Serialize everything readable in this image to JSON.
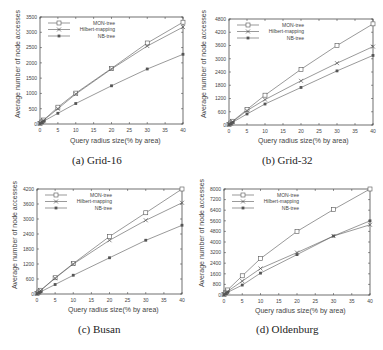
{
  "chart_data": [
    {
      "type": "line",
      "title": "Grid-16",
      "caption": "(a) Grid-16",
      "xlabel": "Query radius size(% by area)",
      "ylabel": "Average number of node accesses",
      "x": [
        0,
        0.5,
        1,
        5,
        10,
        20,
        30,
        40
      ],
      "xticks": [
        0,
        5,
        10,
        15,
        20,
        25,
        30,
        35,
        40
      ],
      "yticks": [
        0,
        500,
        1000,
        1500,
        2000,
        2500,
        3000,
        3500
      ],
      "xlim": [
        0,
        40
      ],
      "ylim": [
        0,
        3500
      ],
      "legend_position": "top-left",
      "series": [
        {
          "name": "MON-tree",
          "marker": "open-square",
          "values": [
            20,
            70,
            130,
            550,
            1010,
            1820,
            2650,
            3330
          ]
        },
        {
          "name": "Hilbert-mapping",
          "marker": "cross",
          "values": [
            20,
            65,
            120,
            500,
            980,
            1800,
            2550,
            3170
          ]
        },
        {
          "name": "NB-tree",
          "marker": "filled-square",
          "values": [
            15,
            45,
            90,
            350,
            670,
            1250,
            1800,
            2280
          ]
        }
      ]
    },
    {
      "type": "line",
      "title": "Grid-32",
      "caption": "(b) Grid-32",
      "xlabel": "Query radius size(% by area)",
      "ylabel": "Average number of node accesses",
      "x": [
        0,
        0.5,
        1,
        5,
        10,
        20,
        30,
        40
      ],
      "xticks": [
        0,
        5,
        10,
        15,
        20,
        25,
        30,
        35,
        40
      ],
      "yticks": [
        0,
        600,
        1200,
        1800,
        2400,
        3000,
        3600,
        4200,
        4800
      ],
      "xlim": [
        0,
        40
      ],
      "ylim": [
        0,
        4800
      ],
      "legend_position": "top-left",
      "series": [
        {
          "name": "MON-tree",
          "marker": "open-square",
          "values": [
            30,
            90,
            170,
            700,
            1350,
            2520,
            3600,
            4580
          ]
        },
        {
          "name": "Hilbert-mapping",
          "marker": "cross",
          "values": [
            25,
            80,
            150,
            650,
            1150,
            2000,
            2800,
            3550
          ]
        },
        {
          "name": "NB-tree",
          "marker": "filled-square",
          "values": [
            20,
            60,
            120,
            500,
            950,
            1700,
            2450,
            3150
          ]
        }
      ]
    },
    {
      "type": "line",
      "title": "Busan",
      "caption": "(c) Busan",
      "xlabel": "Query radius size(% by area)",
      "ylabel": "Average number of node accesses",
      "x": [
        0,
        0.5,
        1,
        5,
        10,
        20,
        30,
        40
      ],
      "xticks": [
        0,
        5,
        10,
        15,
        20,
        25,
        30,
        35,
        40
      ],
      "yticks": [
        0,
        600,
        1200,
        1800,
        2400,
        3000,
        3600,
        4200
      ],
      "xlim": [
        0,
        40
      ],
      "ylim": [
        0,
        4200
      ],
      "legend_position": "top-left",
      "series": [
        {
          "name": "MON-tree",
          "marker": "open-square",
          "values": [
            25,
            80,
            150,
            650,
            1220,
            2300,
            3250,
            4200
          ]
        },
        {
          "name": "Hilbert-mapping",
          "marker": "cross",
          "values": [
            25,
            75,
            140,
            630,
            1200,
            2150,
            2950,
            3650
          ]
        },
        {
          "name": "NB-tree",
          "marker": "filled-square",
          "values": [
            15,
            50,
            90,
            380,
            750,
            1450,
            2150,
            2750
          ]
        }
      ]
    },
    {
      "type": "line",
      "title": "Oldenburg",
      "caption": "(d) Oldenburg",
      "xlabel": "Query radius size(% by area)",
      "ylabel": "Average number of node accesses",
      "x": [
        0,
        0.5,
        1,
        5,
        10,
        20,
        30,
        40
      ],
      "xticks": [
        0,
        5,
        10,
        15,
        20,
        25,
        30,
        35,
        40
      ],
      "yticks": [
        0,
        800,
        1600,
        2400,
        3200,
        4000,
        4800,
        5600,
        6400,
        7200,
        8000
      ],
      "xlim": [
        0,
        40
      ],
      "ylim": [
        0,
        8000
      ],
      "legend_position": "top-left",
      "series": [
        {
          "name": "MON-tree",
          "marker": "open-square",
          "values": [
            50,
            200,
            380,
            1450,
            2750,
            4800,
            6450,
            8000
          ]
        },
        {
          "name": "Hilbert-mapping",
          "marker": "cross",
          "values": [
            40,
            150,
            280,
            1050,
            2000,
            3200,
            4450,
            5300
          ]
        },
        {
          "name": "NB-tree",
          "marker": "filled-square",
          "values": [
            30,
            100,
            200,
            750,
            1650,
            3050,
            4450,
            5600
          ]
        }
      ]
    }
  ],
  "panels": [
    {
      "caption": "(a) Grid-16",
      "xlabel": "Query radius size(% by area)",
      "ylabel": "Average number of node accesses"
    },
    {
      "caption": "(b) Grid-32",
      "xlabel": "Query radius size(% by area)",
      "ylabel": "Average number of node accesses"
    },
    {
      "caption": "(c) Busan",
      "xlabel": "Query radius size(% by area)",
      "ylabel": "Average number of node accesses"
    },
    {
      "caption": "(d) Oldenburg",
      "xlabel": "Query radius size(% by area)",
      "ylabel": "Average number of node accesses"
    }
  ],
  "colors": {
    "axis": "#333333",
    "line": "#555555",
    "text": "#444444"
  }
}
